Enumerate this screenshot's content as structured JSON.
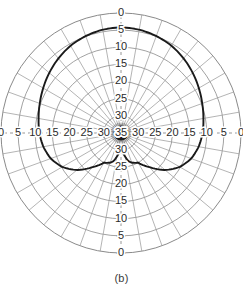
{
  "figure": {
    "caption": "(b)",
    "type": "polar-radiation-pattern"
  },
  "colors": {
    "grid": "#8a8a8a",
    "grid_minor": "#9b9b9b",
    "curve": "#1a1a1a",
    "axis_dash": "#8a8a8a",
    "text": "#2b2b2b",
    "background": "#ffffff",
    "hub": "#111111"
  },
  "axes": {
    "vertical_top_labels": [
      "0",
      "5",
      "10",
      "15",
      "20",
      "25",
      "30",
      "35"
    ],
    "vertical_bottom_labels": [
      "35",
      "30",
      "25",
      "20",
      "15",
      "10",
      "5",
      "0"
    ],
    "horizontal_left_labels": [
      "0",
      "5",
      "10",
      "15",
      "20",
      "25",
      "30",
      "35"
    ],
    "horizontal_right_labels": [
      "35",
      "30",
      "25",
      "20",
      "15",
      "10",
      "5",
      "0"
    ],
    "center_label": "35"
  },
  "chart_data": {
    "type": "line",
    "title": "",
    "subtitle": "",
    "xlabel": "",
    "ylabel": "",
    "projection": "polar",
    "grid": true,
    "legend": null,
    "radial_axis": {
      "label": "Attenuation (dB)",
      "ticks": [
        0,
        5,
        10,
        15,
        20,
        25,
        30,
        35
      ],
      "rlim": [
        0,
        35
      ],
      "inverted": true,
      "outer_value": 0,
      "center_value": 35,
      "ring_count": 8,
      "ring_step": 5
    },
    "angular_axis": {
      "label": "Angle (degrees)",
      "spoke_step_deg": 10,
      "zero_at": "top",
      "direction": "clockwise",
      "range_deg": [
        0,
        360
      ]
    },
    "series": [
      {
        "name": "Measured pattern",
        "units": "dB",
        "theta_deg": [
          0,
          10,
          20,
          30,
          40,
          50,
          60,
          70,
          80,
          90,
          100,
          110,
          120,
          130,
          140,
          150,
          160,
          165,
          170,
          175,
          180,
          185,
          190,
          195,
          200,
          210,
          220,
          230,
          240,
          250,
          260,
          270,
          280,
          290,
          300,
          310,
          320,
          330,
          340,
          350,
          360
        ],
        "r_db": [
          4.2,
          4.4,
          4.9,
          5.6,
          6.6,
          7.7,
          8.8,
          9.8,
          10.6,
          11.2,
          12.0,
          13.2,
          15.2,
          18.2,
          22.0,
          25.0,
          25.8,
          26.5,
          28.0,
          29.5,
          30.2,
          29.5,
          28.0,
          26.5,
          25.8,
          25.0,
          22.0,
          18.2,
          15.2,
          13.2,
          12.0,
          11.2,
          10.6,
          9.8,
          8.8,
          7.7,
          6.6,
          5.6,
          4.9,
          4.4,
          4.2
        ]
      }
    ],
    "annotations": [
      {
        "text": "main lobe peak",
        "theta_deg": 0,
        "r_db": 4.2
      },
      {
        "text": "null/notch",
        "theta_deg": 180,
        "r_db": 30.2
      }
    ]
  }
}
